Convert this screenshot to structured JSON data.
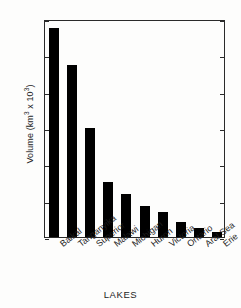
{
  "chart_data": {
    "type": "bar",
    "title": "",
    "subtitle": "",
    "xlabel": "LAKES",
    "ylabel": "Volume (km³ x 10³)",
    "ylabel_base": "Volume (km",
    "ylabel_sup1": "3",
    "ylabel_mid": " x 10",
    "ylabel_sup2": "3",
    "ylabel_end": ")",
    "categories": [
      "Baikal",
      "Tanganyika",
      "Superior",
      "Malawi",
      "Michigan",
      "Huron",
      "Victoria",
      "Ontario",
      "Aral Sea",
      "Erie"
    ],
    "values": [
      23.0,
      18.9,
      12.0,
      6.1,
      4.7,
      3.4,
      2.7,
      1.6,
      1.0,
      0.5
    ],
    "ylim": [
      0,
      24
    ],
    "yticks": [
      0,
      4,
      8,
      12,
      16,
      20,
      24
    ],
    "ytick_labels": [
      "0",
      "4",
      "8",
      "12",
      "16",
      "20",
      "24"
    ],
    "grid": false,
    "legend": false,
    "legend_position": "none",
    "bar_color": "#000000",
    "axis_color": "#2a2a2a",
    "background_color": "#fdfdfc"
  }
}
